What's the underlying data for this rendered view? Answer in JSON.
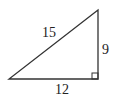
{
  "diagram": {
    "type": "right-triangle",
    "vertices": {
      "top": [
        98,
        10
      ],
      "bottom_left": [
        9,
        79
      ],
      "bottom_right": [
        98,
        79
      ]
    },
    "right_angle_at": "bottom_right",
    "labels": {
      "hypotenuse": "15",
      "vertical_leg": "9",
      "horizontal_leg": "12"
    },
    "stroke_color": "#333333"
  }
}
